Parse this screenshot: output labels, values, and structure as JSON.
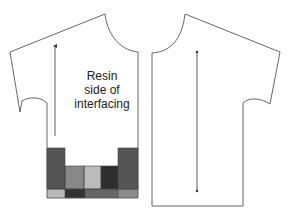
{
  "diagram": {
    "type": "sewing-pattern",
    "pieces": [
      {
        "id": "left-piece",
        "description": "Shirt front/back piece with patchwork panel at hem"
      },
      {
        "id": "right-piece",
        "description": "Mirrored shirt piece, plain"
      }
    ],
    "label": {
      "lines": [
        "Resin",
        "side of",
        "interfacing"
      ]
    },
    "grainlines": [
      {
        "piece": "left-piece",
        "direction": "up-arrow"
      },
      {
        "piece": "right-piece",
        "direction": "double-ended"
      }
    ],
    "patchwork": {
      "colors": {
        "dark_gray": "#555555",
        "mid_gray": "#888888",
        "light_gray": "#bbbbbb",
        "near_black": "#2e2e2e",
        "medium_dark": "#666666"
      }
    },
    "colors": {
      "outline": "#555555",
      "background": "#ffffff",
      "text": "#222222"
    }
  }
}
